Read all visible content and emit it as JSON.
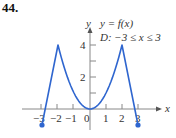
{
  "problem_number": "44.",
  "chart_data": {
    "type": "line",
    "title": "y = f(x)",
    "subtitle": "D: −3 ≤ x ≤ 3",
    "xlabel": "x",
    "ylabel": "y",
    "xticks": [
      -3,
      -2,
      -1,
      0,
      1,
      2,
      3
    ],
    "yticks": [
      2,
      4
    ],
    "xlim": [
      -4,
      4.5
    ],
    "ylim": [
      -1,
      5
    ],
    "grid": false,
    "series": [
      {
        "name": "f(x)",
        "color": "#2f66cf",
        "points": [
          [
            -3,
            -1
          ],
          [
            -2,
            4
          ],
          [
            -1.5,
            2.25
          ],
          [
            -1,
            1
          ],
          [
            -0.5,
            0.25
          ],
          [
            0,
            0
          ],
          [
            0.5,
            0.25
          ],
          [
            1,
            1
          ],
          [
            1.5,
            2.25
          ],
          [
            2,
            4
          ],
          [
            3,
            -1
          ]
        ],
        "segments": [
          {
            "from": -3,
            "to": -2,
            "shape": "linear"
          },
          {
            "from": -2,
            "to": 2,
            "shape": "parabola y = x^2"
          },
          {
            "from": 2,
            "to": 3,
            "shape": "linear"
          }
        ],
        "endpoints": [
          {
            "x": -3,
            "y": -1,
            "closed": true
          },
          {
            "x": 3,
            "y": -1,
            "closed": true
          }
        ]
      }
    ]
  },
  "labels": {
    "y_axis": "y",
    "x_axis": "x",
    "function": "y = f(x)",
    "domain": "D:  −3 ≤ x ≤ 3",
    "x_tick_labels": [
      "−3",
      "−2",
      "−1",
      "0",
      "1",
      "2",
      "3"
    ],
    "y_tick_labels": [
      "4",
      "2"
    ]
  }
}
